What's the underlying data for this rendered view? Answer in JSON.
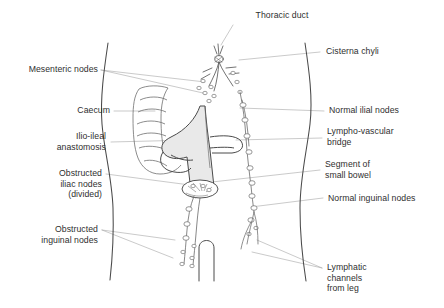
{
  "figure": {
    "type": "anatomical-line-diagram",
    "colors": {
      "background": "#ffffff",
      "ink": "#4a4a4a",
      "text": "#2f2f2f",
      "leader_line": "#9a9a9a",
      "bowel_shading": "#e6e6e6",
      "node_fill": "#ffffff"
    }
  },
  "labels": {
    "thoracic_duct": "Thoracic duct",
    "cisterna_chyli": "Cisterna chyli",
    "mesenteric_nodes": "Mesenteric nodes",
    "caecum": "Caecum",
    "normal_ilial_nodes": "Normal ilial nodes",
    "ilio_ileal_anastomosis": "Ilio-ileal\nanastomosis",
    "lympho_vascular_bridge": "Lympho-vascular\nbridge",
    "obstructed_iliac_nodes": "Obstructed\niliac nodes\n(divided)",
    "segment_of_small_bowel": "Segment of\nsmall bowel",
    "normal_inguinal_nodes": "Normal inguinal nodes",
    "obstructed_inguinal_nodes": "Obstructed\ninguinal nodes",
    "lymphatic_channels_from_leg": "Lymphatic\nchannels\nfrom leg"
  }
}
